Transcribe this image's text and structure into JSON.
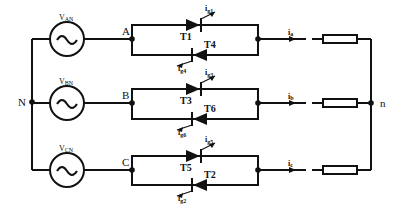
{
  "diagram": {
    "type": "three-phase AC voltage controller (thyristor anti-parallel pairs, star-connected resistive load)",
    "neutral_source": "N",
    "neutral_load": "n",
    "phases": [
      {
        "source_label": "V",
        "source_sub": "AN",
        "node": "A",
        "forward_thyristor": "T1",
        "forward_gate": "i",
        "forward_gate_sub": "g1",
        "reverse_thyristor": "T4",
        "reverse_gate": "i",
        "reverse_gate_sub": "g4",
        "current": "i",
        "current_sub": "a"
      },
      {
        "source_label": "V",
        "source_sub": "BN",
        "node": "B",
        "forward_thyristor": "T3",
        "forward_gate": "i",
        "forward_gate_sub": "g3",
        "reverse_thyristor": "T6",
        "reverse_gate": "i",
        "reverse_gate_sub": "g6",
        "current": "i",
        "current_sub": "b"
      },
      {
        "source_label": "V",
        "source_sub": "CN",
        "node": "C",
        "forward_thyristor": "T5",
        "forward_gate": "i",
        "forward_gate_sub": "g5",
        "reverse_thyristor": "T2",
        "reverse_gate": "i",
        "reverse_gate_sub": "g2",
        "current": "i",
        "current_sub": "c"
      }
    ],
    "source_symbol": "~"
  }
}
